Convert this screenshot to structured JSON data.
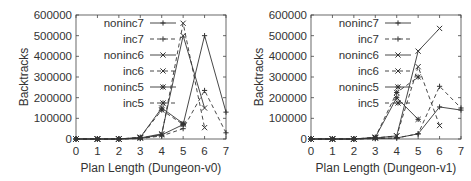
{
  "chart_data": [
    {
      "type": "line",
      "title": "",
      "xlabel": "Plan Length (Dungeon-v0)",
      "ylabel": "Backtracks",
      "x": [
        0,
        1,
        2,
        3,
        4,
        5,
        6,
        7
      ],
      "xlim": [
        0,
        7
      ],
      "ylim": [
        0,
        600000
      ],
      "yticks": [
        0,
        100000,
        200000,
        300000,
        400000,
        500000,
        600000
      ],
      "xticks": [
        0,
        1,
        2,
        3,
        4,
        5,
        6,
        7
      ],
      "grid": false,
      "legend_position": "upper-left-inside",
      "series": [
        {
          "name": "noninc7",
          "style": "solid",
          "marker": "+",
          "x": [
            0,
            1,
            2,
            3,
            4,
            5,
            6,
            7
          ],
          "values": [
            0,
            0,
            0,
            3000,
            20000,
            70000,
            500000,
            130000
          ]
        },
        {
          "name": "inc7",
          "style": "dashed",
          "marker": "+",
          "x": [
            0,
            1,
            2,
            3,
            4,
            5,
            6,
            7
          ],
          "values": [
            0,
            0,
            0,
            2000,
            15000,
            50000,
            235000,
            30000
          ]
        },
        {
          "name": "noninc6",
          "style": "solid",
          "marker": "x",
          "x": [
            0,
            1,
            2,
            3,
            4,
            5,
            6
          ],
          "values": [
            0,
            0,
            0,
            5000,
            25000,
            500000,
            150000
          ]
        },
        {
          "name": "inc6",
          "style": "dashed",
          "marker": "x",
          "x": [
            0,
            1,
            2,
            3,
            4,
            5,
            6
          ],
          "values": [
            0,
            0,
            0,
            5000,
            20000,
            560000,
            55000
          ]
        },
        {
          "name": "noninc5",
          "style": "solid",
          "marker": "*",
          "x": [
            0,
            1,
            2,
            3,
            4,
            5
          ],
          "values": [
            0,
            0,
            0,
            8000,
            150000,
            75000
          ]
        },
        {
          "name": "inc5",
          "style": "dashed",
          "marker": "*",
          "x": [
            0,
            1,
            2,
            3,
            4,
            5
          ],
          "values": [
            0,
            0,
            0,
            8000,
            140000,
            70000
          ]
        }
      ]
    },
    {
      "type": "line",
      "title": "",
      "xlabel": "Plan Length (Dungeon-v1)",
      "ylabel": "Backtracks",
      "x": [
        0,
        1,
        2,
        3,
        4,
        5,
        6,
        7
      ],
      "xlim": [
        0,
        7
      ],
      "ylim": [
        0,
        600000
      ],
      "yticks": [
        0,
        100000,
        200000,
        300000,
        400000,
        500000,
        600000
      ],
      "xticks": [
        0,
        1,
        2,
        3,
        4,
        5,
        6,
        7
      ],
      "grid": false,
      "legend_position": "upper-left-inside",
      "series": [
        {
          "name": "noninc7",
          "style": "solid",
          "marker": "+",
          "x": [
            0,
            1,
            2,
            3,
            4,
            5,
            6,
            7
          ],
          "values": [
            0,
            0,
            0,
            2000,
            5000,
            25000,
            155000,
            140000
          ]
        },
        {
          "name": "inc7",
          "style": "dashed",
          "marker": "+",
          "x": [
            0,
            1,
            2,
            3,
            4,
            5,
            6,
            7
          ],
          "values": [
            0,
            0,
            0,
            2000,
            5000,
            25000,
            255000,
            150000
          ]
        },
        {
          "name": "noninc6",
          "style": "solid",
          "marker": "x",
          "x": [
            0,
            1,
            2,
            3,
            4,
            5,
            6
          ],
          "values": [
            0,
            0,
            0,
            5000,
            15000,
            425000,
            535000
          ]
        },
        {
          "name": "inc6",
          "style": "dashed",
          "marker": "x",
          "x": [
            0,
            1,
            2,
            3,
            4,
            5,
            6
          ],
          "values": [
            0,
            0,
            0,
            5000,
            15000,
            350000,
            65000
          ]
        },
        {
          "name": "noninc5",
          "style": "solid",
          "marker": "*",
          "x": [
            0,
            1,
            2,
            3,
            4,
            5
          ],
          "values": [
            0,
            0,
            0,
            8000,
            200000,
            95000
          ]
        },
        {
          "name": "inc5",
          "style": "dashed",
          "marker": "*",
          "x": [
            0,
            1,
            2,
            3,
            4,
            5
          ],
          "values": [
            0,
            0,
            0,
            8000,
            225000,
            300000
          ]
        }
      ]
    }
  ]
}
